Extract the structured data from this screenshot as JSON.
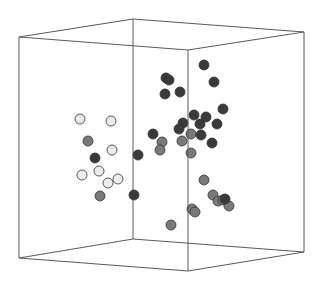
{
  "chart_data": {
    "type": "scatter3d",
    "title": "",
    "xlabel": "",
    "ylabel": "",
    "zlabel": "",
    "grid": false,
    "legend": null,
    "box": {
      "corners": {
        "front_top_left": [
          19,
          37
        ],
        "back_top_left": [
          133,
          19
        ],
        "back_top_right": [
          304,
          32
        ],
        "front_top_right": [
          188,
          50
        ],
        "front_bottom_left": [
          19,
          258
        ],
        "back_bottom_left": [
          133,
          239
        ],
        "back_bottom_right": [
          304,
          252
        ],
        "front_bottom_right": [
          188,
          271
        ]
      },
      "color": "#5a5a5a"
    },
    "series": [
      {
        "name": "group-light",
        "color": "#ececec",
        "points": [
          [
            80,
            119
          ],
          [
            111,
            121
          ],
          [
            112,
            150
          ],
          [
            82,
            175
          ],
          [
            99,
            171
          ],
          [
            108,
            183
          ],
          [
            118,
            179
          ]
        ]
      },
      {
        "name": "group-medium",
        "color": "#7a7a7a",
        "points": [
          [
            88,
            141
          ],
          [
            100,
            196
          ],
          [
            191,
            134
          ],
          [
            162,
            142
          ],
          [
            182,
            141
          ],
          [
            160,
            150
          ],
          [
            191,
            153
          ],
          [
            204,
            180
          ],
          [
            213,
            195
          ],
          [
            218,
            201
          ],
          [
            223,
            200
          ],
          [
            229,
            206
          ],
          [
            192,
            209
          ],
          [
            195,
            212
          ],
          [
            171,
            225
          ]
        ]
      },
      {
        "name": "group-dark",
        "color": "#3a3a3a",
        "points": [
          [
            95,
            158
          ],
          [
            138,
            155
          ],
          [
            134,
            195
          ],
          [
            204,
            65
          ],
          [
            166,
            78
          ],
          [
            169,
            80
          ],
          [
            214,
            82
          ],
          [
            165,
            94
          ],
          [
            180,
            92
          ],
          [
            223,
            109
          ],
          [
            194,
            115
          ],
          [
            206,
            117
          ],
          [
            200,
            124
          ],
          [
            183,
            123
          ],
          [
            217,
            124
          ],
          [
            179,
            129
          ],
          [
            153,
            134
          ],
          [
            201,
            135
          ],
          [
            212,
            143
          ],
          [
            225,
            199
          ]
        ]
      }
    ],
    "point_radius": 5
  }
}
